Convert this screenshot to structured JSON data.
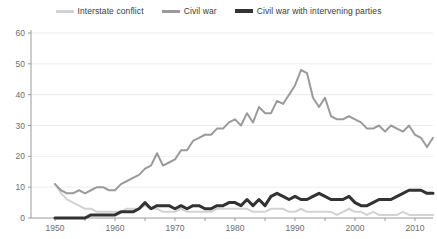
{
  "legend": {
    "position": "top",
    "entries": [
      {
        "label": "Interstate conflict",
        "color": "#d2d2d2",
        "weight": "thin"
      },
      {
        "label": "Civil war",
        "color": "#9a9a9a",
        "weight": "thin"
      },
      {
        "label": "Civil war with intervening parties",
        "color": "#333333",
        "weight": "thick"
      }
    ]
  },
  "axes": {
    "y_ticks": [
      "0",
      "10",
      "20",
      "30",
      "40",
      "50",
      "60"
    ],
    "x_ticks": [
      "1950",
      "1960",
      "1970",
      "1980",
      "1990",
      "2000",
      "2010"
    ]
  },
  "chart_data": {
    "type": "line",
    "title": "",
    "subtitle": "",
    "xlabel": "",
    "ylabel": "",
    "xlim": [
      1946,
      2013
    ],
    "ylim": [
      0,
      60
    ],
    "yticks": [
      0,
      10,
      20,
      30,
      40,
      50,
      60
    ],
    "xticks": [
      1950,
      1960,
      1970,
      1980,
      1990,
      2000,
      2010
    ],
    "grid": "horizontal",
    "legend_position": "top",
    "x": [
      1950,
      1951,
      1952,
      1953,
      1954,
      1955,
      1956,
      1957,
      1958,
      1959,
      1960,
      1961,
      1962,
      1963,
      1964,
      1965,
      1966,
      1967,
      1968,
      1969,
      1970,
      1971,
      1972,
      1973,
      1974,
      1975,
      1976,
      1977,
      1978,
      1979,
      1980,
      1981,
      1982,
      1983,
      1984,
      1985,
      1986,
      1987,
      1988,
      1989,
      1990,
      1991,
      1992,
      1993,
      1994,
      1995,
      1996,
      1997,
      1998,
      1999,
      2000,
      2001,
      2002,
      2003,
      2004,
      2005,
      2006,
      2007,
      2008,
      2009,
      2010,
      2011,
      2012,
      2013
    ],
    "series": [
      {
        "name": "Interstate conflict",
        "color": "#d2d2d2",
        "width": 2,
        "values": [
          11,
          8,
          6,
          5,
          4,
          3,
          3,
          2,
          2,
          2,
          2,
          2,
          3,
          3,
          3,
          4,
          3,
          3,
          2,
          2,
          2,
          3,
          2,
          2,
          2,
          2,
          2,
          3,
          3,
          3,
          3,
          3,
          3,
          2,
          2,
          2,
          3,
          3,
          3,
          2,
          2,
          3,
          2,
          2,
          2,
          2,
          2,
          1,
          2,
          3,
          2,
          2,
          1,
          2,
          1,
          1,
          1,
          1,
          2,
          1,
          1,
          1,
          1,
          1
        ]
      },
      {
        "name": "Civil war",
        "color": "#9a9a9a",
        "width": 2,
        "values": [
          11,
          9,
          8,
          8,
          9,
          8,
          9,
          10,
          10,
          9,
          9,
          11,
          12,
          13,
          14,
          16,
          17,
          21,
          17,
          18,
          19,
          22,
          22,
          25,
          26,
          27,
          27,
          29,
          29,
          31,
          32,
          30,
          34,
          31,
          36,
          34,
          34,
          38,
          37,
          40,
          43,
          48,
          47,
          39,
          36,
          39,
          33,
          32,
          32,
          33,
          32,
          31,
          29,
          29,
          30,
          28,
          30,
          29,
          28,
          30,
          27,
          26,
          23,
          26
        ]
      },
      {
        "name": "Civil war with intervening parties",
        "color": "#333333",
        "width": 3,
        "values": [
          0,
          0,
          0,
          0,
          0,
          0,
          1,
          1,
          1,
          1,
          1,
          2,
          2,
          2,
          3,
          5,
          3,
          4,
          4,
          4,
          3,
          4,
          3,
          4,
          4,
          3,
          3,
          4,
          4,
          5,
          5,
          4,
          6,
          4,
          6,
          4,
          7,
          8,
          7,
          6,
          7,
          6,
          6,
          7,
          8,
          7,
          6,
          6,
          6,
          7,
          5,
          4,
          4,
          5,
          6,
          6,
          6,
          7,
          8,
          9,
          9,
          9,
          8,
          8
        ]
      }
    ]
  }
}
